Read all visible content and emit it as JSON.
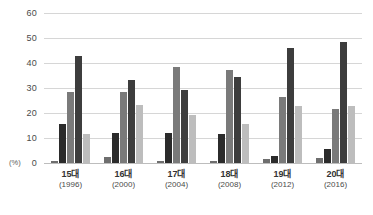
{
  "chart_data": {
    "type": "bar",
    "title": "",
    "subtitle": "",
    "xlabel": "",
    "ylabel": "(%)",
    "ylim": [
      0,
      60
    ],
    "yticks": [
      0,
      10,
      20,
      30,
      40,
      50,
      60
    ],
    "ytick_labels": [
      "0",
      "10",
      "20",
      "30",
      "40",
      "50",
      "60"
    ],
    "grid": true,
    "legend": "none",
    "categories": [
      "15대",
      "16대",
      "17대",
      "18대",
      "19대",
      "20대"
    ],
    "category_sublabels": [
      "(1996)",
      "(2000)",
      "(2004)",
      "(2008)",
      "(2012)",
      "(2016)"
    ],
    "series": [
      {
        "name": "series-1",
        "color": "#6e6e6e",
        "values": [
          0.7,
          2.6,
          0.8,
          0.8,
          1.5,
          2.0
        ]
      },
      {
        "name": "series-2",
        "color": "#2b2b2b",
        "values": [
          15.5,
          12.0,
          12.0,
          11.8,
          2.8,
          5.5
        ]
      },
      {
        "name": "series-3",
        "color": "#7a7a7a",
        "values": [
          28.5,
          28.5,
          38.6,
          37.1,
          26.6,
          21.5
        ]
      },
      {
        "name": "series-4",
        "color": "#3d3d3d",
        "values": [
          43.0,
          33.2,
          29.3,
          34.4,
          46.2,
          48.5
        ]
      },
      {
        "name": "series-5",
        "color": "#bdbdbd",
        "values": [
          11.5,
          23.4,
          19.2,
          15.7,
          22.8,
          23.0
        ]
      }
    ],
    "colors": {
      "grid": "#d6d6d6",
      "baseline": "#bdbdbd",
      "tick_text": "#4a4a4a",
      "label_text": "#333333",
      "background": "#ffffff"
    }
  }
}
